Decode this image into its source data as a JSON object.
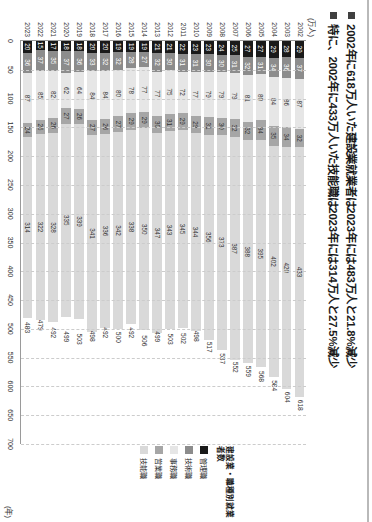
{
  "header": {
    "bullets": [
      "2002年に618万人いた建設業就業者は2023年には483万人と21.8%減少",
      "特に、2002年に433万人いた技能職は2023年には314万人と27.5%減少"
    ]
  },
  "legend": {
    "title": "建設業・職種別就業者数",
    "items": [
      {
        "label": "管理職",
        "color": "#1a1a1a"
      },
      {
        "label": "技術職",
        "color": "#8c8c8c"
      },
      {
        "label": "事務職",
        "color": "#e6e6e6"
      },
      {
        "label": "営業職",
        "color": "#a6a6a6"
      },
      {
        "label": "技能職",
        "color": "#d9d9d9"
      }
    ]
  },
  "chart_data": {
    "type": "bar",
    "orientation": "horizontal-stacked",
    "title": "建設業・職種別就業者数",
    "xlabel": "(万人)",
    "ylabel": "(年)",
    "unit_label": "(万人)",
    "year_axis_label": "(年)",
    "xlim": [
      0,
      700
    ],
    "xticks": [
      0,
      50,
      100,
      150,
      200,
      250,
      300,
      350,
      400,
      450,
      500,
      550,
      600,
      650,
      700
    ],
    "grid": true,
    "legend_position": "right",
    "categories": [
      "2002",
      "2003",
      "2004",
      "2005",
      "2006",
      "2007",
      "2008",
      "2009",
      "2010",
      "2011",
      "2012",
      "2013",
      "2014",
      "2015",
      "2016",
      "2017",
      "2018",
      "2019",
      "2020",
      "2021",
      "2022",
      "2023"
    ],
    "series": [
      {
        "name": "管理職",
        "color": "#1a1a1a",
        "values": [
          29,
          28,
          29,
          27,
          27,
          25,
          24,
          23,
          23,
          22,
          21,
          21,
          19,
          19,
          19,
          20,
          20,
          18,
          18,
          17,
          15,
          20
        ]
      },
      {
        "name": "技術職",
        "color": "#8c8c8c",
        "values": [
          37,
          36,
          34,
          31,
          32,
          31,
          30,
          30,
          31,
          31,
          30,
          32,
          27,
          28,
          32,
          32,
          33,
          36,
          37,
          35,
          37,
          36
        ]
      },
      {
        "name": "事務職",
        "color": "#e6e6e6",
        "values": [
          87,
          86,
          84,
          80,
          81,
          79,
          79,
          79,
          77,
          72,
          75,
          77,
          77,
          78,
          80,
          84,
          84,
          64,
          62,
          82,
          85,
          87
        ]
      },
      {
        "name": "営業職",
        "color": "#a6a6a6",
        "values": [
          32,
          34,
          35,
          34,
          32,
          32,
          30,
          31,
          29,
          29,
          31,
          30,
          29,
          29,
          27,
          26,
          27,
          26,
          27,
          26,
          25,
          24
        ]
      },
      {
        "name": "技能職",
        "color": "#d9d9d9",
        "values": [
          433,
          420,
          402,
          395,
          388,
          387,
          373,
          356,
          344,
          345,
          343,
          347,
          350,
          338,
          342,
          336,
          341,
          339,
          335,
          328,
          322,
          314
        ]
      }
    ],
    "totals": [
      618,
      604,
      584,
      568,
      559,
      552,
      537,
      517,
      498,
      502,
      503,
      499,
      506,
      492,
      500,
      492,
      498,
      503,
      499,
      492,
      479,
      483
    ],
    "total_labels": [
      "618",
      "604",
      "584",
      "568",
      "559",
      "552",
      "537",
      "517",
      "498",
      "502",
      "503",
      "499",
      "506",
      "492",
      "500",
      "492",
      "498",
      "503",
      "499",
      "492",
      "479",
      "483"
    ]
  }
}
